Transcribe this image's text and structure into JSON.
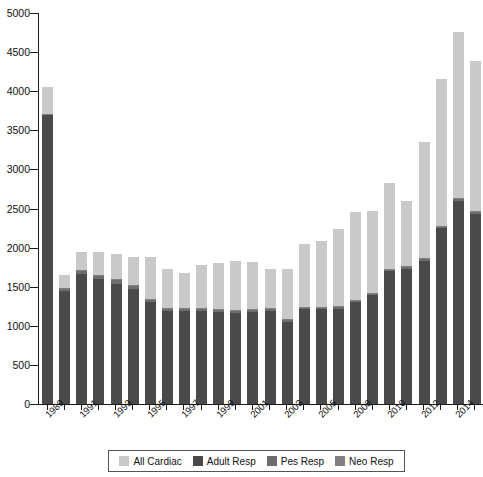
{
  "chart_data": {
    "type": "bar",
    "stacked": true,
    "title": "",
    "xlabel": "",
    "ylabel": "",
    "ylim": [
      0,
      5000
    ],
    "ytick_values": [
      0,
      500,
      1000,
      1500,
      2000,
      2500,
      3000,
      3500,
      4000,
      4500,
      5000
    ],
    "ytick_labels": [
      "0",
      "500",
      "1000",
      "1500",
      "2000",
      "2500",
      "3000",
      "3500",
      "4000",
      "4500",
      "5000"
    ],
    "grid": false,
    "legend_position": "bottom",
    "categories": [
      "1989",
      "1990",
      "1991",
      "1992",
      "1993",
      "1994",
      "1995",
      "1996",
      "1997",
      "1998",
      "1999",
      "2000",
      "2001",
      "2002",
      "2003",
      "2004",
      "2005",
      "2006",
      "2008",
      "2009",
      "2010",
      "2011",
      "2012",
      "2013",
      "2014",
      "2015"
    ],
    "xtick_labels_shown": [
      "1989",
      "",
      "1991",
      "",
      "1993",
      "",
      "1995",
      "",
      "1997",
      "",
      "1999",
      "",
      "2001",
      "",
      "2003",
      "",
      "2005",
      "",
      "2008",
      "",
      "2010",
      "",
      "2012",
      "",
      "2014",
      ""
    ],
    "series": [
      {
        "name": "Adult Resp",
        "color": "#4a4a4a",
        "values": [
          3700,
          1440,
          1660,
          1600,
          1540,
          1470,
          1300,
          1190,
          1190,
          1190,
          1180,
          1170,
          1180,
          1190,
          1050,
          1210,
          1210,
          1220,
          1300,
          1390,
          1700,
          1730,
          1830,
          2250,
          2600,
          2430
        ]
      },
      {
        "name": "Pes Resp",
        "color": "#6e6e6e",
        "values": [
          0,
          30,
          40,
          40,
          40,
          40,
          30,
          20,
          20,
          20,
          20,
          20,
          20,
          20,
          20,
          20,
          20,
          20,
          20,
          20,
          20,
          20,
          20,
          20,
          20,
          20
        ]
      },
      {
        "name": "Neo Resp",
        "color": "#808080",
        "values": [
          15,
          10,
          10,
          10,
          10,
          10,
          10,
          10,
          10,
          10,
          10,
          10,
          10,
          10,
          10,
          10,
          10,
          10,
          10,
          10,
          10,
          10,
          10,
          10,
          10,
          10
        ]
      },
      {
        "name": "All Cardiac",
        "color": "#c9c9c9",
        "values": [
          340,
          170,
          230,
          290,
          320,
          360,
          540,
          510,
          450,
          560,
          590,
          620,
          600,
          500,
          650,
          800,
          840,
          980,
          1120,
          1040,
          1090,
          830,
          1490,
          1870,
          2120,
          1920
        ]
      }
    ],
    "totals": [
      4055,
      1650,
      1940,
      1940,
      1910,
      1880,
      1880,
      1730,
      1670,
      1780,
      1800,
      1820,
      1810,
      1720,
      1730,
      2040,
      2080,
      2230,
      2450,
      2820,
      2820,
      2590,
      3350,
      4150,
      4750,
      4380
    ]
  },
  "legend": {
    "items": [
      {
        "label": "All Cardiac",
        "color": "#c9c9c9"
      },
      {
        "label": "Adult Resp",
        "color": "#4a4a4a"
      },
      {
        "label": "Pes Resp",
        "color": "#6e6e6e"
      },
      {
        "label": "Neo Resp",
        "color": "#808080"
      }
    ]
  }
}
